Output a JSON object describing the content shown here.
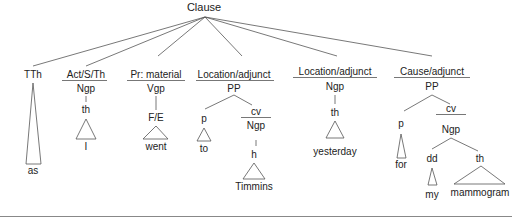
{
  "root": {
    "label": "Clause"
  },
  "constituents": [
    {
      "function": "TTh",
      "children": [],
      "leaf": "as"
    },
    {
      "function": "Act/S/Th",
      "group": "Ngp",
      "sub": "th",
      "leaf": "I"
    },
    {
      "function": "Pr: material",
      "group": "Vgp",
      "sub": "F/E",
      "leaf": "went"
    },
    {
      "function": "Location/adjunct",
      "group": "PP",
      "p": {
        "label": "p",
        "leaf": "to"
      },
      "cv": {
        "label": "cv",
        "group": "Ngp",
        "sub": "h",
        "leaf": "Timmins"
      }
    },
    {
      "function": "Location/adjunct",
      "group": "Ngp",
      "sub": "th",
      "leaf": "yesterday"
    },
    {
      "function": "Cause/adjunct",
      "group": "PP",
      "p": {
        "label": "p",
        "leaf": "for"
      },
      "cv": {
        "label": "cv",
        "group": "Ngp",
        "dd": {
          "label": "dd",
          "leaf": "my"
        },
        "th": {
          "label": "th",
          "leaf": "mammogram"
        }
      }
    }
  ],
  "colors": {
    "line": "#555555",
    "text": "#222222",
    "rule": "#777777"
  }
}
